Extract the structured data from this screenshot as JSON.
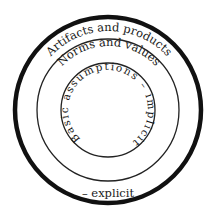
{
  "diagram": {
    "type": "concentric-circles",
    "colors": {
      "stroke": "#111111",
      "text": "#1a1a1a",
      "background": "#ffffff"
    },
    "layers": [
      {
        "label": "Artifacts and products",
        "level": "outer"
      },
      {
        "label": "Norms and values",
        "level": "middle"
      },
      {
        "label": "Basic assumptions – implicit",
        "level": "inner"
      }
    ],
    "bottom_label": "– explicit"
  }
}
